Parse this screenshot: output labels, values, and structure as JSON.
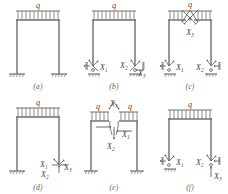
{
  "figure": {
    "load_symbol": "q",
    "redundants": {
      "x1": "X",
      "x2": "X",
      "x3": "X",
      "s1": "1",
      "s2": "2",
      "s3": "3"
    },
    "colors": {
      "line": "#6e6e6e",
      "label": "#3f3f3f",
      "arrow": "#5a5a5a",
      "hatch": "#8a8a8a",
      "background": "#ffffff"
    }
  },
  "panels": [
    {
      "id": "a",
      "caption": "(a)",
      "loads": [
        "q"
      ],
      "supports": [
        "fixed-base-left",
        "fixed-base-right"
      ],
      "redundant_labels": [],
      "cut": false
    },
    {
      "id": "b",
      "caption": "(b)",
      "loads": [
        "q"
      ],
      "supports": [
        "pinned-roller-left",
        "pinned-roller-right"
      ],
      "redundant_labels": [
        "X1",
        "X2",
        "X3"
      ],
      "cut": false
    },
    {
      "id": "c",
      "caption": "(c)",
      "loads": [
        "q"
      ],
      "supports": [
        "pinned-roller-left",
        "pinned-roller-right"
      ],
      "redundant_labels": [
        "X1",
        "X2",
        "X3"
      ],
      "cut": true,
      "cut_location": "beam-midspan"
    },
    {
      "id": "d",
      "caption": "(d)",
      "loads": [
        "q"
      ],
      "supports": [
        "fixed-base-left",
        "free-end-right"
      ],
      "redundant_labels": [
        "X1",
        "X2",
        "X3"
      ],
      "cut": false
    },
    {
      "id": "e",
      "caption": "(e)",
      "loads": [
        "q",
        "q"
      ],
      "supports": [
        "fixed-base-left",
        "fixed-base-right"
      ],
      "redundant_labels": [
        "X1",
        "X2",
        "X3"
      ],
      "cut": true,
      "cut_location": "beam-midspan"
    },
    {
      "id": "f",
      "caption": "(f)",
      "loads": [
        "q"
      ],
      "supports": [
        "pinned-roller-left",
        "pinned-roller-right"
      ],
      "redundant_labels": [
        "X1",
        "X2",
        "X3"
      ],
      "cut": false
    }
  ]
}
